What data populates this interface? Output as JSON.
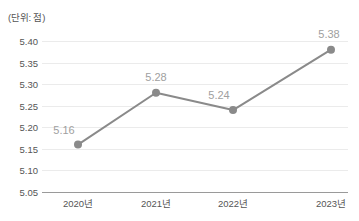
{
  "unit_note": "(단위: 점)",
  "axis": {
    "y_ticks": [
      "5.40",
      "5.35",
      "5.30",
      "5.25",
      "5.20",
      "5.15",
      "5.10",
      "5.05"
    ],
    "x_ticks": [
      "2020년",
      "2021년",
      "2022년",
      "2023년"
    ]
  },
  "point_labels": [
    "5.16",
    "5.28",
    "5.24",
    "5.38"
  ],
  "colors": {
    "line": "#8a8a8a",
    "marker": "#8a8a8a",
    "gridline": "#ebebeb",
    "axis_line": "#9a9a9a",
    "tick_text": "#555555",
    "data_label": "#a0a0a0",
    "background": "#ffffff"
  },
  "chart_data": {
    "type": "line",
    "title": "",
    "subtitle": "",
    "xlabel": "",
    "ylabel": "",
    "unit": "(단위: 점)",
    "categories": [
      "2020년",
      "2021년",
      "2022년",
      "2023년"
    ],
    "values": [
      5.16,
      5.28,
      5.24,
      5.38
    ],
    "data_labels": [
      "5.16",
      "5.28",
      "5.24",
      "5.38"
    ],
    "ylim": [
      5.05,
      5.4
    ],
    "ytick_values": [
      5.4,
      5.35,
      5.3,
      5.25,
      5.2,
      5.15,
      5.1,
      5.05
    ],
    "ytick_labels": [
      "5.40",
      "5.35",
      "5.30",
      "5.25",
      "5.20",
      "5.15",
      "5.10",
      "5.05"
    ],
    "ytick_step": 0.05,
    "grid": {
      "horizontal": true,
      "vertical": false
    },
    "legend": {
      "visible": false,
      "position": "none"
    },
    "markers": {
      "visible": true,
      "shape": "circle"
    },
    "series": [
      {
        "name": "점수",
        "values": [
          5.16,
          5.28,
          5.24,
          5.38
        ]
      }
    ]
  }
}
